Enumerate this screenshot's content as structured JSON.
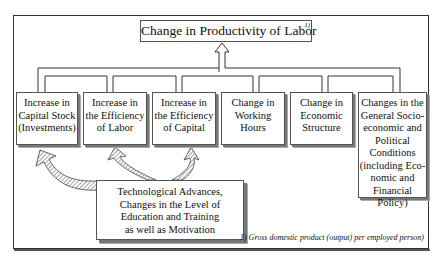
{
  "title": {
    "text": "Change in Productivity of Labor",
    "footnote_marker": "1)"
  },
  "factors": [
    {
      "label": "Increase in Capital Stock (Investments)",
      "lines": [
        "Increase in",
        "Capital Stock",
        "(Investments)"
      ]
    },
    {
      "label": "Increase in the Efficiency of Labor",
      "lines": [
        "Increase in",
        "the Efficiency",
        "of Labor"
      ]
    },
    {
      "label": "Increase in the Efficiency of Capital",
      "lines": [
        "Increase in",
        "the Efficiency",
        "of Capital"
      ]
    },
    {
      "label": "Change in Working Hours",
      "lines": [
        "Change in",
        "Working",
        "Hours"
      ]
    },
    {
      "label": "Change in Economic Structure",
      "lines": [
        "Change in",
        "Economic",
        "Structure"
      ]
    },
    {
      "label": "Changes in the General Socio-economic and Political Conditions (including Economic and Financial Policy)",
      "lines": [
        "Changes in the",
        "General Socio-",
        "economic and",
        "Political",
        "Conditions",
        "(including Eco-",
        "nomic and",
        "Financial Policy)"
      ]
    }
  ],
  "drivers": {
    "label": "Technological Advances, Changes in the Level of Education and Training as well as Motivation",
    "lines": [
      "Technological Advances,",
      "Changes in the Level of",
      "Education and Training",
      "as well as Motivation"
    ],
    "influences": [
      "Increase in Capital Stock (Investments)",
      "Increase in the Efficiency of Labor",
      "Increase in the Efficiency of Capital"
    ]
  },
  "footnote": "1) Gross domestic product (output) per employed person)"
}
